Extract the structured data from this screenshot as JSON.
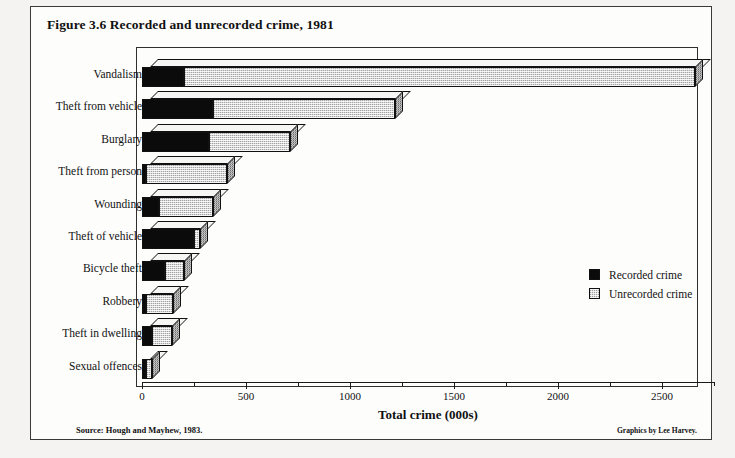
{
  "figure": {
    "title": "Figure 3.6  Recorded and unrecorded crime, 1981",
    "source": "Source: Hough and Mayhew, 1983.",
    "credit": "Graphics by Lee Harvey."
  },
  "legend": {
    "recorded_label": "Recorded crime",
    "unrecorded_label": "Unrecorded crime",
    "recorded_color": "#0b0b0b",
    "unrecorded_color": "#d8d8d8"
  },
  "chart_data": {
    "type": "bar",
    "orientation": "horizontal",
    "stacked": true,
    "style": "3d",
    "title": "Figure 3.6  Recorded and unrecorded crime, 1981",
    "xlabel": "Total crime (000s)",
    "ylabel": "",
    "xlim": [
      0,
      2750
    ],
    "xticks": [
      0,
      500,
      1000,
      1500,
      2000,
      2500
    ],
    "xtick_labels": [
      "0",
      "500",
      "1000",
      "1500",
      "2000",
      "2500"
    ],
    "minor_xticks": [
      250,
      750,
      1250,
      1750,
      2250,
      2750
    ],
    "grid": false,
    "legend_position": "middle-right",
    "categories": [
      "Vandalism",
      "Theft from vehicle",
      "Burglary",
      "Theft from person",
      "Wounding",
      "Theft of vehicle",
      "Bicycle theft",
      "Robbery",
      "Theft in dwelling",
      "Sexual offences"
    ],
    "series": [
      {
        "name": "Recorded crime",
        "values": [
          200,
          340,
          320,
          20,
          80,
          250,
          110,
          20,
          50,
          20
        ]
      },
      {
        "name": "Unrecorded crime",
        "values": [
          2460,
          875,
          390,
          390,
          260,
          30,
          90,
          130,
          95,
          30
        ]
      }
    ],
    "totals": [
      2660,
      1215,
      710,
      410,
      340,
      280,
      200,
      150,
      145,
      50
    ],
    "units": "thousands of offences"
  }
}
